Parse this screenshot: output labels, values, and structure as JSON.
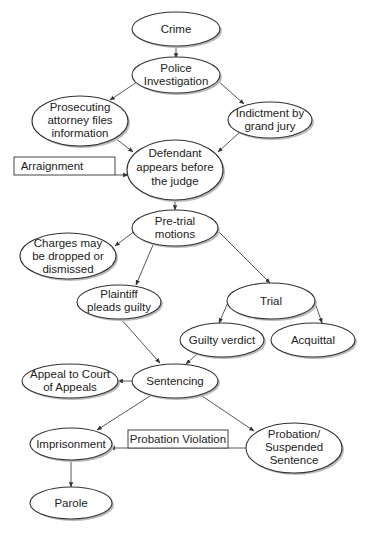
{
  "diagram": {
    "nodes": {
      "crime": {
        "lines": [
          "Crime"
        ]
      },
      "police": {
        "lines": [
          "Police",
          "Investigation"
        ]
      },
      "prosecuting": {
        "lines": [
          "Prosecuting",
          "attorney files",
          "information"
        ]
      },
      "indictment": {
        "lines": [
          "Indictment by",
          "grand jury"
        ]
      },
      "defendant": {
        "lines": [
          "Defendant",
          "appears before",
          "the judge"
        ]
      },
      "pretrial": {
        "lines": [
          "Pre-trial",
          "motions"
        ]
      },
      "charges": {
        "lines": [
          "Charges may",
          "be dropped or",
          "dismissed"
        ]
      },
      "plaintiff": {
        "lines": [
          "Plaintiff",
          "pleads guilty"
        ]
      },
      "trial": {
        "lines": [
          "Trial"
        ]
      },
      "guilty": {
        "lines": [
          "Guilty verdict"
        ]
      },
      "acquittal": {
        "lines": [
          "Acquittal"
        ]
      },
      "sentencing": {
        "lines": [
          "Sentencing"
        ]
      },
      "appeal": {
        "lines": [
          "Appeal to Court",
          "of Appeals"
        ]
      },
      "imprisonment": {
        "lines": [
          "Imprisonment"
        ]
      },
      "probation": {
        "lines": [
          "Probation/",
          "Suspended",
          "Sentence"
        ]
      },
      "parole": {
        "lines": [
          "Parole"
        ]
      }
    },
    "labels": {
      "arraignment": "Arraignment",
      "probation_violation": "Probation Violation"
    },
    "edges": [
      [
        "crime",
        "police"
      ],
      [
        "police",
        "prosecuting"
      ],
      [
        "police",
        "indictment"
      ],
      [
        "prosecuting",
        "defendant"
      ],
      [
        "indictment",
        "defendant"
      ],
      [
        "arraignment",
        "defendant"
      ],
      [
        "defendant",
        "pretrial"
      ],
      [
        "pretrial",
        "charges"
      ],
      [
        "pretrial",
        "plaintiff"
      ],
      [
        "pretrial",
        "trial"
      ],
      [
        "trial",
        "guilty"
      ],
      [
        "trial",
        "acquittal"
      ],
      [
        "plaintiff",
        "sentencing"
      ],
      [
        "guilty",
        "sentencing"
      ],
      [
        "sentencing",
        "appeal"
      ],
      [
        "sentencing",
        "imprisonment"
      ],
      [
        "sentencing",
        "probation"
      ],
      [
        "probation",
        "imprisonment"
      ],
      [
        "imprisonment",
        "parole"
      ]
    ]
  }
}
